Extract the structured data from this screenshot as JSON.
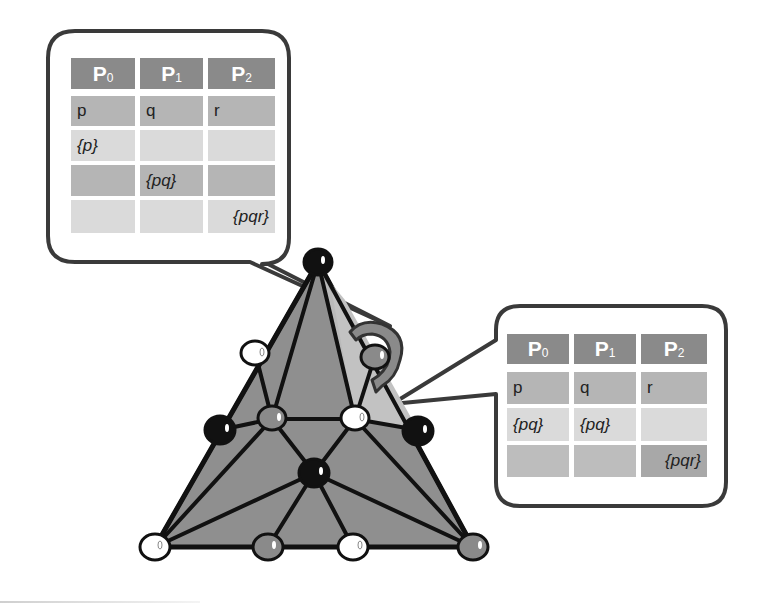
{
  "colors": {
    "header_bg": "#8a8a8a",
    "row_dark": "#b5b5b5",
    "row_light": "#dadada",
    "triangle_fill": "#8f8f8f",
    "highlight_fill": "#c2c2c2",
    "arrow_fill": "#8a8a8a",
    "edge": "#111111",
    "bubble_stroke": "#3a3a3a",
    "node_black": "#111111",
    "node_white": "#ffffff",
    "node_gray": "#8a8a8a"
  },
  "left_callout": {
    "headers": [
      {
        "base": "P",
        "sub": "0"
      },
      {
        "base": "P",
        "sub": "1"
      },
      {
        "base": "P",
        "sub": "2"
      }
    ],
    "rows": [
      {
        "shade": "dark",
        "cells": [
          {
            "text": "p",
            "italic": false
          },
          {
            "text": "q",
            "italic": false
          },
          {
            "text": "r",
            "italic": false
          }
        ]
      },
      {
        "shade": "light",
        "cells": [
          {
            "text": "{p}",
            "italic": true
          },
          {
            "text": "",
            "italic": false
          },
          {
            "text": "",
            "italic": false
          }
        ]
      },
      {
        "shade": "dark",
        "cells": [
          {
            "text": "",
            "italic": false
          },
          {
            "text": "{pq}",
            "italic": true
          },
          {
            "text": "",
            "italic": false
          }
        ]
      },
      {
        "shade": "light",
        "cells": [
          {
            "text": "",
            "italic": false
          },
          {
            "text": "",
            "italic": false
          },
          {
            "text": "{pqr}",
            "italic": true
          }
        ]
      }
    ]
  },
  "right_callout": {
    "headers": [
      {
        "base": "P",
        "sub": "0"
      },
      {
        "base": "P",
        "sub": "1"
      },
      {
        "base": "P",
        "sub": "2"
      }
    ],
    "rows": [
      {
        "shade": "dark",
        "cells": [
          {
            "text": "p",
            "italic": false
          },
          {
            "text": "q",
            "italic": false
          },
          {
            "text": "r",
            "italic": false
          }
        ]
      },
      {
        "shade": "light",
        "cells": [
          {
            "text": "{pq}",
            "italic": true
          },
          {
            "text": "{pq}",
            "italic": true
          },
          {
            "text": "",
            "italic": false
          }
        ]
      },
      {
        "shade": "dark",
        "cells": [
          {
            "text": "",
            "italic": false
          },
          {
            "text": "",
            "italic": false
          },
          {
            "text": "{pqr}",
            "italic": true
          }
        ],
        "highlight_last": true
      }
    ]
  },
  "triangle": {
    "vertices": [
      {
        "id": "apex",
        "x": 318,
        "y": 262,
        "color": "black"
      },
      {
        "id": "upper-left",
        "x": 255,
        "y": 352,
        "color": "white"
      },
      {
        "id": "upper-right",
        "x": 375,
        "y": 356,
        "color": "gray"
      },
      {
        "id": "mid-left",
        "x": 220,
        "y": 430,
        "color": "black"
      },
      {
        "id": "inner-left",
        "x": 272,
        "y": 419,
        "color": "gray"
      },
      {
        "id": "inner-right",
        "x": 355,
        "y": 419,
        "color": "white"
      },
      {
        "id": "mid-right",
        "x": 418,
        "y": 430,
        "color": "black"
      },
      {
        "id": "center",
        "x": 314,
        "y": 473,
        "color": "black"
      },
      {
        "id": "bottom-left",
        "x": 155,
        "y": 547,
        "color": "white"
      },
      {
        "id": "bottom-mid-left",
        "x": 268,
        "y": 547,
        "color": "gray"
      },
      {
        "id": "bottom-mid-right",
        "x": 353,
        "y": 547,
        "color": "white"
      },
      {
        "id": "bottom-right",
        "x": 473,
        "y": 547,
        "color": "gray"
      }
    ]
  }
}
